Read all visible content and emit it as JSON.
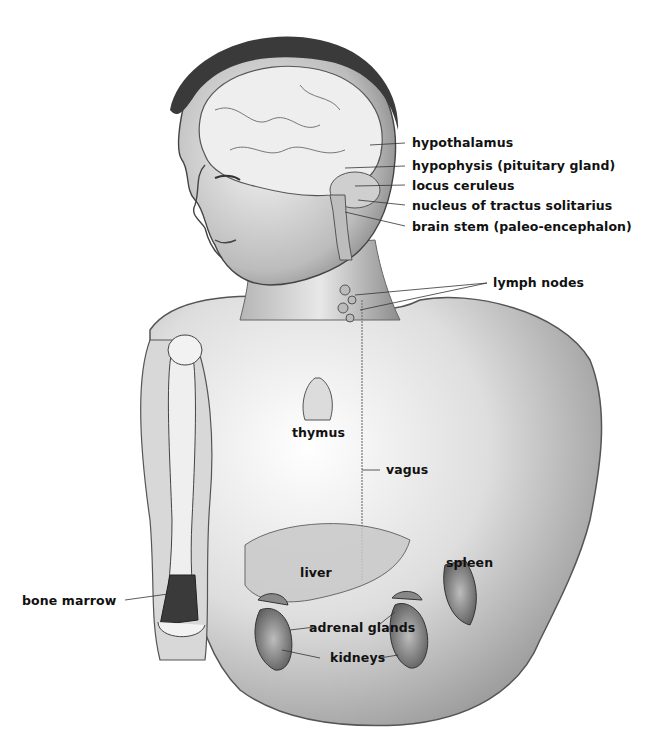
{
  "figure": {
    "colors": {
      "ink": "#111111",
      "shade": "#6b6b6b",
      "skin": "#d9d9d9",
      "background": "#ffffff"
    },
    "labels": {
      "hypothalamus": "hypothalamus",
      "hypophysis": "hypophysis (pituitary gland)",
      "locus_ceruleus": "locus ceruleus",
      "nucleus_tractus": "nucleus of tractus solitarius",
      "brain_stem": "brain stem (paleo-encephalon)",
      "lymph_nodes": "lymph nodes",
      "thymus": "thymus",
      "vagus": "vagus",
      "bone_marrow": "bone marrow",
      "liver": "liver",
      "spleen": "spleen",
      "adrenal_glands": "adrenal glands",
      "kidneys": "kidneys"
    }
  }
}
